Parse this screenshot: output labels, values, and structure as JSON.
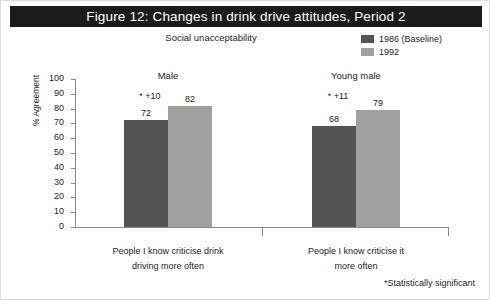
{
  "figure": {
    "title": "Figure 12: Changes in drink drive attitudes, Period 2",
    "subtitle": "Social unacceptability",
    "footnote": "*Statistically significant"
  },
  "colors": {
    "title_band": "#1b1b1b",
    "title_text": "#ffffff",
    "series_1986": "#545454",
    "series_1992": "#a0a0a0",
    "axis": "#8a8a8a",
    "text": "#1d1d1d"
  },
  "chart_data": {
    "type": "bar",
    "title": "Figure 12: Changes in drink drive attitudes, Period 2",
    "subtitle": "Social unacceptability",
    "xlabel": "",
    "ylabel": "% Agreement",
    "ylim": [
      0,
      100
    ],
    "ytick_step": 10,
    "yticks": [
      100,
      90,
      80,
      70,
      60,
      50,
      40,
      30,
      20,
      10,
      0
    ],
    "grid": false,
    "legend_position": "top-right",
    "categories": [
      "People I know criticise drink driving more often",
      "People I know criticise it more often"
    ],
    "category_lines": [
      [
        "People I know criticise drink",
        "driving more often"
      ],
      [
        "People I know criticise it",
        "more often"
      ]
    ],
    "group_labels": [
      "Male",
      "Young male"
    ],
    "series": [
      {
        "name": "1986 (Baseline)",
        "color": "#545454",
        "values": [
          72,
          68
        ]
      },
      {
        "name": "1992",
        "color": "#a0a0a0",
        "values": [
          82,
          79
        ]
      }
    ],
    "annotations": [
      {
        "group": "Male",
        "text": "* +10",
        "value": 10,
        "significant": true
      },
      {
        "group": "Young male",
        "text": "* +11",
        "value": 11,
        "significant": true
      }
    ],
    "footnote": "*Statistically significant"
  },
  "legend": {
    "items": [
      {
        "label": "1986 (Baseline)",
        "color": "#545454"
      },
      {
        "label": "1992",
        "color": "#a0a0a0"
      }
    ]
  },
  "axis": {
    "y_title": "% Agreement"
  }
}
